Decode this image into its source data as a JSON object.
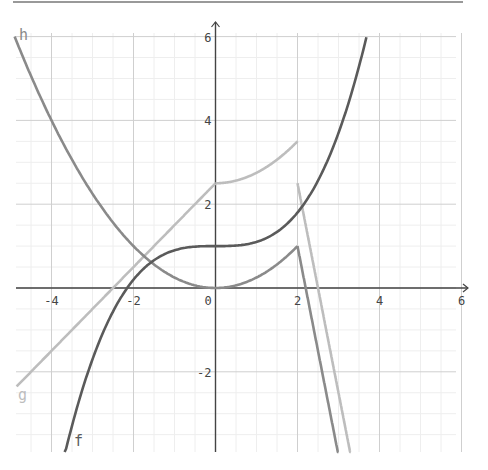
{
  "chart_data": {
    "type": "line",
    "title": "",
    "xlabel": "",
    "ylabel": "",
    "xlim": [
      -4.85,
      6.05
    ],
    "ylim": [
      -3.9,
      6.3
    ],
    "grid": {
      "major_step": 2,
      "minor_step": 0.5
    },
    "x_ticks": [
      "-4",
      "-2",
      "0",
      "2",
      "4",
      "6"
    ],
    "y_ticks": [
      "6",
      "4",
      "2",
      "-2"
    ],
    "series": [
      {
        "name": "f",
        "color": "#5a5a5a",
        "definition": "0.1x^3 + 1",
        "points": [
          [
            -3.68,
            -4
          ],
          [
            -3,
            -1.7
          ],
          [
            -2.15,
            0
          ],
          [
            -2,
            0.2
          ],
          [
            -1,
            0.9
          ],
          [
            0,
            1
          ],
          [
            1,
            1.1
          ],
          [
            2,
            1.8
          ],
          [
            3,
            3.7
          ],
          [
            3.68,
            6
          ]
        ]
      },
      {
        "name": "h",
        "color": "#8a8a8a",
        "definition": "x^2/4 for x<=2; 1-5(x-2) for x>2",
        "points": [
          [
            -4.9,
            6
          ],
          [
            -4,
            4
          ],
          [
            -2,
            1
          ],
          [
            0,
            0
          ],
          [
            1,
            0.25
          ],
          [
            2,
            1
          ],
          [
            2.2,
            0
          ],
          [
            3,
            -4
          ]
        ]
      },
      {
        "name": "g",
        "color": "#bdbdbd",
        "definition": "x+2.5 for x<0; 2.5+x^2/4 for 0<=x<=2; 2.5-5(x-2) for x>2",
        "points": [
          [
            -4.85,
            -2.35
          ],
          [
            -2,
            0.5
          ],
          [
            0,
            2.5
          ],
          [
            1,
            2.75
          ],
          [
            2,
            3.5
          ],
          [
            2,
            2.5
          ],
          [
            2.5,
            0
          ],
          [
            3.3,
            -4
          ]
        ]
      }
    ],
    "labels": {
      "f": "f",
      "g": "g",
      "h": "h"
    }
  },
  "colors": {
    "axis": "#444444",
    "major_grid": "#cfcfcf",
    "minor_grid": "#eeeeee",
    "f": "#5a5a5a",
    "h": "#8a8a8a",
    "g": "#bdbdbd"
  }
}
